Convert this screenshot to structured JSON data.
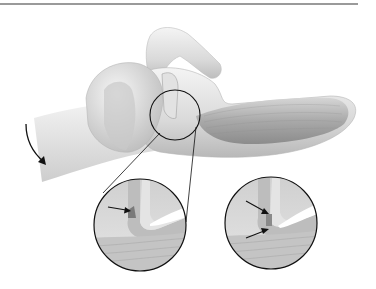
{
  "figure": {
    "type": "anatomical-illustration",
    "colors": {
      "rule": "#9a9a9a",
      "bone_light": "#ececec",
      "bone_mid": "#cfcfcf",
      "bone_dark": "#9e9e9e",
      "muscle": "#a8a8a8",
      "outline": "#1a1a1a"
    },
    "insets": [
      {
        "label": "detail-left",
        "arrows": 1
      },
      {
        "label": "detail-right",
        "arrows": 2
      }
    ],
    "rotation_arrow": true
  }
}
